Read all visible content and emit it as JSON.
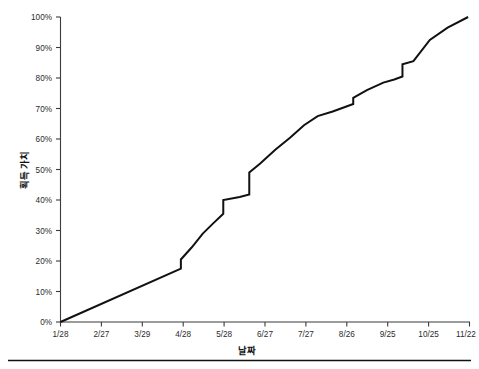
{
  "chart_data": {
    "type": "line",
    "title": "",
    "xlabel": "날짜",
    "ylabel": "획득 가치",
    "xlim": [
      0,
      299
    ],
    "ylim": [
      0,
      100
    ],
    "grid": false,
    "legend": null,
    "x_tick_labels": [
      "1/28",
      "2/27",
      "3/29",
      "4/28",
      "5/28",
      "6/27",
      "7/27",
      "8/26",
      "9/25",
      "10/25",
      "11/22"
    ],
    "x_tick_values": [
      0,
      30,
      60,
      90,
      120,
      150,
      180,
      210,
      240,
      270,
      298
    ],
    "y_tick_labels": [
      "0%",
      "10%",
      "20%",
      "30%",
      "40%",
      "50%",
      "60%",
      "70%",
      "80%",
      "90%",
      "100%"
    ],
    "y_tick_values": [
      0,
      10,
      20,
      30,
      40,
      50,
      60,
      70,
      80,
      90,
      100
    ],
    "series": [
      {
        "name": "획득 가치",
        "x": [
          0,
          88,
          88,
          96,
          104,
          112,
          119,
          119,
          131,
          138,
          138,
          146,
          157,
          168,
          178,
          188,
          188,
          199,
          208,
          214,
          214,
          224,
          236,
          244,
          250,
          250,
          258,
          270,
          283,
          298
        ],
        "y": [
          0,
          17.5,
          20.5,
          24.5,
          29.0,
          32.5,
          35.5,
          40.0,
          41.0,
          41.8,
          49.0,
          52.0,
          56.5,
          60.5,
          64.5,
          67.5,
          67.5,
          69.0,
          70.5,
          71.5,
          73.5,
          76.0,
          78.5,
          79.5,
          80.5,
          84.5,
          85.5,
          92.5,
          96.5,
          100.0
        ]
      }
    ],
    "annotations": []
  },
  "axes": {
    "y_axis_name": "y-axis",
    "x_axis_name": "x-axis"
  },
  "caption": {
    "text": ""
  }
}
